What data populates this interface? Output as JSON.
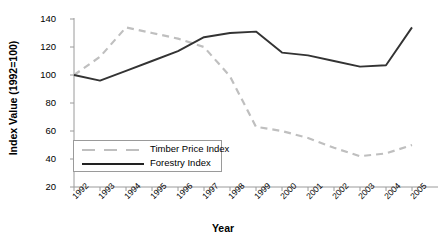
{
  "chart_data": {
    "type": "line",
    "title": "",
    "xlabel": "Year",
    "ylabel": "Index Value (1992=100)",
    "categories": [
      "1992",
      "1993",
      "1994",
      "1995",
      "1996",
      "1997",
      "1998",
      "1999",
      "2000",
      "2001",
      "2002",
      "2003",
      "2004",
      "2005"
    ],
    "x": [
      1992,
      1993,
      1994,
      1995,
      1996,
      1997,
      1998,
      1999,
      2000,
      2001,
      2002,
      2003,
      2004,
      2005
    ],
    "ylim": [
      20,
      140
    ],
    "yticks": [
      20,
      40,
      60,
      80,
      100,
      120,
      140
    ],
    "grid": false,
    "legend_position": "inside-lower-left",
    "series": [
      {
        "name": "Timber Price Index",
        "color": "#bfbfbf",
        "style": "dashed",
        "values": [
          100,
          113,
          134,
          130,
          126,
          120,
          99,
          63,
          60,
          55,
          48,
          42,
          44,
          50
        ]
      },
      {
        "name": "Forestry Index",
        "color": "#333333",
        "style": "solid",
        "values": [
          100,
          96,
          103,
          110,
          117,
          127,
          130,
          131,
          116,
          114,
          110,
          106,
          107,
          134
        ]
      }
    ]
  },
  "axis": {
    "y_title": "Index Value (1992=100)",
    "x_title": "Year"
  },
  "legend": {
    "items": [
      {
        "label": "Timber Price Index"
      },
      {
        "label": "Forestry Index"
      }
    ]
  }
}
